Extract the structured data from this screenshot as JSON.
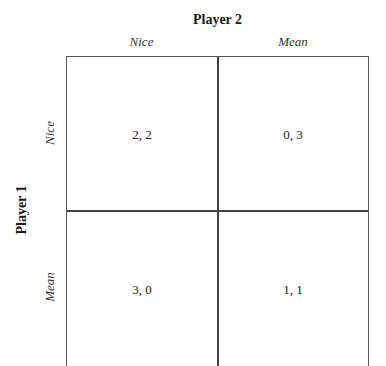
{
  "players": {
    "column_player": "Player 2",
    "row_player": "Player 1"
  },
  "strategies": {
    "columns": [
      "Nice",
      "Mean"
    ],
    "rows": [
      "Nice",
      "Mean"
    ]
  },
  "payoffs": [
    [
      "2, 2",
      "0, 3"
    ],
    [
      "3, 0",
      "1, 1"
    ]
  ]
}
